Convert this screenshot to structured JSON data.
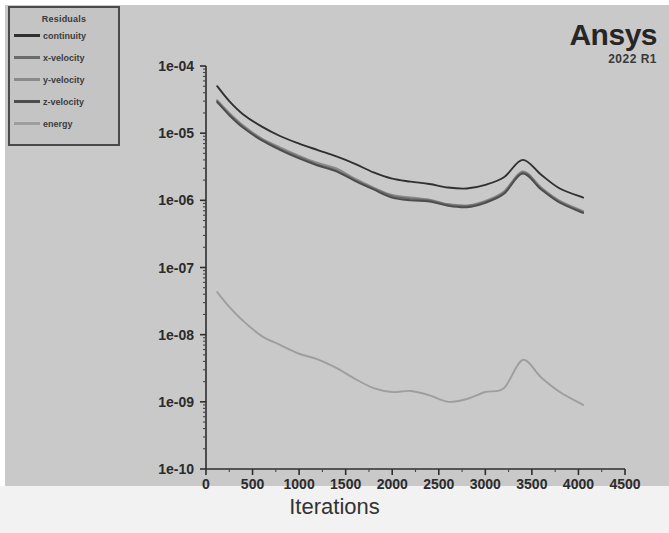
{
  "brand": {
    "name": "Ansys",
    "version": "2022 R1"
  },
  "legend": {
    "title": "Residuals",
    "items": [
      {
        "label": "continuity",
        "color": "#303030"
      },
      {
        "label": "x-velocity",
        "color": "#6b6b6b"
      },
      {
        "label": "y-velocity",
        "color": "#8a8a8a"
      },
      {
        "label": "z-velocity",
        "color": "#4d4d4d"
      },
      {
        "label": "energy",
        "color": "#9e9e9e"
      }
    ]
  },
  "chart_data": {
    "type": "line",
    "title": "Residuals",
    "xlabel": "Iterations",
    "ylabel": "",
    "xlim": [
      0,
      4500
    ],
    "ylim": [
      1e-10,
      0.0001
    ],
    "yscale": "log",
    "grid": false,
    "legend_position": "top-left",
    "xticks": [
      0,
      500,
      1000,
      1500,
      2000,
      2500,
      3000,
      3500,
      4000,
      4500
    ],
    "xtick_labels": [
      "0",
      "500",
      "1000",
      "1500",
      "2000",
      "2500",
      "3000",
      "3500",
      "4000",
      "4500"
    ],
    "yticks": [
      0.0001,
      1e-05,
      1e-06,
      1e-07,
      1e-08,
      1e-09,
      1e-10
    ],
    "ytick_labels": [
      "1e-04",
      "1e-05",
      "1e-06",
      "1e-07",
      "1e-08",
      "1e-09",
      "1e-10"
    ],
    "series": [
      {
        "name": "continuity",
        "color": "#303030",
        "x": [
          120,
          250,
          400,
          600,
          800,
          1000,
          1200,
          1400,
          1600,
          1800,
          2000,
          2200,
          2400,
          2600,
          2800,
          3000,
          3200,
          3400,
          3600,
          3800,
          4050
        ],
        "y": [
          5e-05,
          3e-05,
          1.9e-05,
          1.25e-05,
          9e-06,
          7e-06,
          5.6e-06,
          4.5e-06,
          3.5e-06,
          2.6e-06,
          2.1e-06,
          1.9e-06,
          1.75e-06,
          1.55e-06,
          1.5e-06,
          1.7e-06,
          2.2e-06,
          4e-06,
          2.4e-06,
          1.5e-06,
          1.1e-06
        ]
      },
      {
        "name": "x-velocity",
        "color": "#6b6b6b",
        "x": [
          120,
          250,
          400,
          600,
          800,
          1000,
          1200,
          1400,
          1600,
          1800,
          2000,
          2200,
          2400,
          2600,
          2800,
          3000,
          3200,
          3400,
          3600,
          3800,
          4050
        ],
        "y": [
          3e-05,
          1.9e-05,
          1.25e-05,
          8e-06,
          5.8e-06,
          4.4e-06,
          3.4e-06,
          2.8e-06,
          2e-06,
          1.5e-06,
          1.15e-06,
          1.05e-06,
          1e-06,
          8.6e-07,
          8.2e-07,
          9.5e-07,
          1.3e-06,
          2.6e-06,
          1.5e-06,
          9.5e-07,
          6.7e-07
        ]
      },
      {
        "name": "y-velocity",
        "color": "#8a8a8a",
        "x": [
          120,
          250,
          400,
          600,
          800,
          1000,
          1200,
          1400,
          1600,
          1800,
          2000,
          2200,
          2400,
          2600,
          2800,
          3000,
          3200,
          3400,
          3600,
          3800,
          4050
        ],
        "y": [
          3.1e-05,
          2e-05,
          1.3e-05,
          8.3e-06,
          6.1e-06,
          4.6e-06,
          3.6e-06,
          3e-06,
          2.1e-06,
          1.55e-06,
          1.2e-06,
          1.1e-06,
          1.02e-06,
          8.8e-07,
          8.4e-07,
          9.8e-07,
          1.35e-06,
          2.7e-06,
          1.55e-06,
          9.8e-07,
          6.9e-07
        ]
      },
      {
        "name": "z-velocity",
        "color": "#4d4d4d",
        "x": [
          120,
          250,
          400,
          600,
          800,
          1000,
          1200,
          1400,
          1600,
          1800,
          2000,
          2200,
          2400,
          2600,
          2800,
          3000,
          3200,
          3400,
          3600,
          3800,
          4050
        ],
        "y": [
          2.9e-05,
          1.85e-05,
          1.2e-05,
          7.8e-06,
          5.6e-06,
          4.2e-06,
          3.3e-06,
          2.7e-06,
          1.95e-06,
          1.45e-06,
          1.1e-06,
          1e-06,
          9.6e-07,
          8.3e-07,
          7.9e-07,
          9.2e-07,
          1.25e-06,
          2.5e-06,
          1.45e-06,
          9.2e-07,
          6.5e-07
        ]
      },
      {
        "name": "energy",
        "color": "#9e9e9e",
        "x": [
          120,
          250,
          400,
          600,
          800,
          1000,
          1200,
          1400,
          1600,
          1800,
          2000,
          2200,
          2400,
          2600,
          2800,
          3000,
          3200,
          3400,
          3600,
          3800,
          4050
        ],
        "y": [
          4.3e-08,
          2.6e-08,
          1.6e-08,
          9.5e-09,
          7e-09,
          5.2e-09,
          4.3e-09,
          3.2e-09,
          2.2e-09,
          1.6e-09,
          1.4e-09,
          1.45e-09,
          1.25e-09,
          1e-09,
          1.1e-09,
          1.4e-09,
          1.6e-09,
          4.2e-09,
          2.3e-09,
          1.4e-09,
          9e-10
        ]
      }
    ]
  }
}
